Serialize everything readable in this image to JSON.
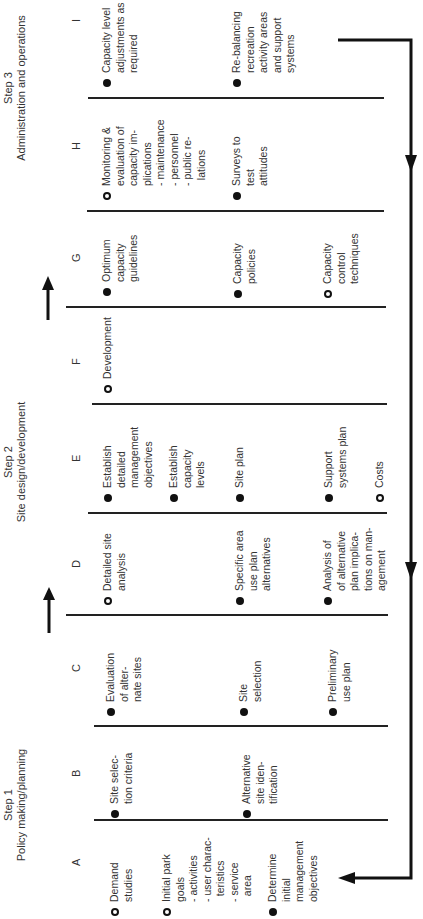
{
  "steps": [
    {
      "title": "Step 3",
      "subtitle": "Administration and operations"
    },
    {
      "title": "Step 2",
      "subtitle": "Site design/development"
    },
    {
      "title": "Step 1",
      "subtitle": "Policy making/planning"
    }
  ],
  "columns": {
    "A": {
      "letter": "A",
      "items": [
        {
          "bullet": "open",
          "text": "Demand\nstudies"
        },
        {
          "bullet": "open",
          "text": "Initial park\ngoals\n- activities\n- user charac-\n  teristics\n- service\n  area"
        },
        {
          "bullet": "filled",
          "text": "Determine\ninitial\nmanagement\nobjectives"
        }
      ]
    },
    "B": {
      "letter": "B",
      "items": [
        {
          "bullet": "filled",
          "text": "Site selec-\ntion criteria"
        },
        {
          "bullet": "filled",
          "text": "Alternative\nsite iden-\ntification"
        }
      ]
    },
    "C": {
      "letter": "C",
      "items": [
        {
          "bullet": "filled",
          "text": "Evaluation\nof alter-\nnate sites"
        },
        {
          "bullet": "filled",
          "text": "Site\nselection"
        },
        {
          "bullet": "filled",
          "text": "Preliminary\nuse plan"
        }
      ]
    },
    "D": {
      "letter": "D",
      "items": [
        {
          "bullet": "open",
          "text": "Detailed site\nanalysis"
        },
        {
          "bullet": "filled",
          "text": "Specific area\nuse plan\nalternatives"
        },
        {
          "bullet": "filled",
          "text": "Analysis of\nof alternative\nplan implica-\ntions on man-\nagement"
        }
      ]
    },
    "E": {
      "letter": "E",
      "items": [
        {
          "bullet": "filled",
          "text": "Establish\ndetailed\nmanagement\nobjectives"
        },
        {
          "bullet": "filled",
          "text": "Establish\ncapacity\nlevels"
        },
        {
          "bullet": "filled",
          "text": "Site plan"
        },
        {
          "bullet": "filled",
          "text": "Support\nsystems plan"
        },
        {
          "bullet": "open",
          "text": "Costs"
        }
      ]
    },
    "F": {
      "letter": "F",
      "items": [
        {
          "bullet": "open",
          "text": "Development"
        }
      ]
    },
    "G": {
      "letter": "G",
      "items": [
        {
          "bullet": "filled",
          "text": "Optimum\ncapacity\nguidelines"
        },
        {
          "bullet": "filled",
          "text": "Capacity\npolicies"
        },
        {
          "bullet": "open",
          "text": "Capacity\ncontrol\ntechniques"
        }
      ]
    },
    "H": {
      "letter": "H",
      "items": [
        {
          "bullet": "open",
          "text": "Monitoring &\nevaluation of\ncapacity im-\nplications\n- maintenance\n- personnel\n- public re-\n  lations"
        },
        {
          "bullet": "filled",
          "text": "Surveys to\ntest\nattitudes"
        }
      ]
    },
    "I": {
      "letter": "I",
      "items": [
        {
          "bullet": "filled",
          "text": "Capacity level\nadjustments as\nrequired"
        },
        {
          "bullet": "filled",
          "text": "Re-balancing\nrecreation\nactivity areas\nand support\nsystems"
        }
      ]
    }
  }
}
